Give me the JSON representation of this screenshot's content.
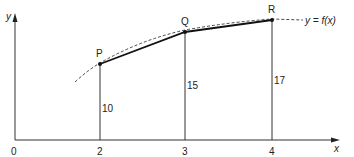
{
  "diagram": {
    "function_label": "y = f(x)",
    "axes": {
      "x_label": "x",
      "y_label": "y",
      "origin_label": "0"
    },
    "x_ticks": [
      "2",
      "3",
      "4"
    ],
    "points": [
      {
        "name": "P",
        "x": 2,
        "y": 10,
        "ordinate_label": "10"
      },
      {
        "name": "Q",
        "x": 3,
        "y": 15,
        "ordinate_label": "15"
      },
      {
        "name": "R",
        "x": 4,
        "y": 17,
        "ordinate_label": "17"
      }
    ],
    "colors": {
      "line": "#1a1a1a",
      "curve": "#333333",
      "background": "#ffffff"
    }
  }
}
